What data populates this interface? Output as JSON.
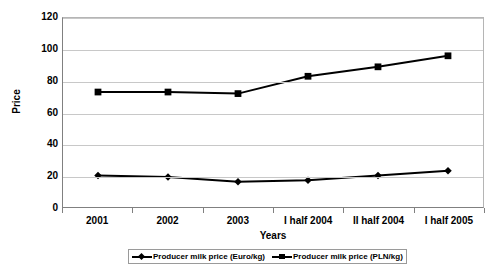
{
  "chart_data": {
    "type": "line",
    "title": "",
    "xlabel": "Years",
    "ylabel": "Price",
    "categories": [
      "2001",
      "2002",
      "2003",
      "I half 2004",
      "II half 2004",
      "I half 2005"
    ],
    "series": [
      {
        "name": "Producer milk price (Euro/kg)",
        "marker": "diamond",
        "color": "#000000",
        "values": [
          20,
          19,
          16,
          17,
          20,
          23
        ]
      },
      {
        "name": "Producer milk price (PLN/kg)",
        "marker": "square",
        "color": "#000000",
        "values": [
          73,
          73,
          72,
          83,
          89,
          96
        ]
      }
    ],
    "ylim": [
      0,
      120
    ],
    "yticks": [
      0,
      20,
      40,
      60,
      80,
      100,
      120
    ],
    "ytick_labels": [
      "0",
      "20",
      "40",
      "60",
      "80",
      "100",
      "120"
    ],
    "grid": true,
    "grid_axis": "y",
    "legend": {
      "position": "bottom",
      "entries": [
        "Producer milk price (Euro/kg)",
        "Producer milk price (PLN/kg)"
      ]
    }
  },
  "axes": {
    "y_title": "Price",
    "x_title": "Years"
  }
}
